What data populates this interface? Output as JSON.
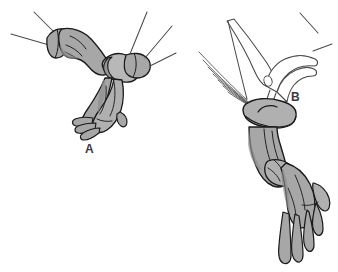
{
  "figure": {
    "background_color": "#ffffff",
    "width": 338,
    "height": 272,
    "panels": [
      {
        "id": "panel-a",
        "label": "A",
        "label_x": 85,
        "label_y": 143,
        "description": "Gloved hand grasping the folded cuff of a second glove, holding it out with fingers hanging downward"
      },
      {
        "id": "panel-b",
        "label": "B",
        "label_x": 291,
        "label_y": 91,
        "description": "Bare fingers pinching the everted glove cuff over the gown sleeve of a gloved forearm pointing down"
      }
    ],
    "colors": {
      "glove_fill": "#a7a7a7",
      "glove_fill_light": "#b8b8b8",
      "glove_fill_dark": "#949494",
      "outline": "#1a1a1a",
      "line": "#4a4a4a",
      "skin_fill": "#ffffff",
      "label_color": "#3b3b3b",
      "background": "#ffffff"
    }
  }
}
